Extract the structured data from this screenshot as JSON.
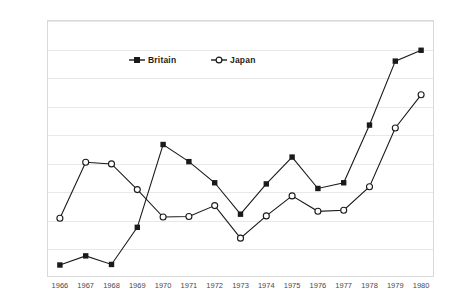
{
  "chart_data": {
    "type": "line",
    "title": "",
    "xlabel": "",
    "ylabel": "",
    "categories": [
      1966,
      1967,
      1968,
      1969,
      1970,
      1971,
      1972,
      1973,
      1974,
      1975,
      1976,
      1977,
      1978,
      1979,
      1980
    ],
    "xtick_labels": [
      "1966",
      "1967",
      "1968",
      "1969",
      "1970",
      "1971",
      "1972",
      "1973",
      "1974",
      "1975",
      "1976",
      "1977",
      "1978",
      "1979",
      "1980"
    ],
    "ytick_labels": [
      "0",
      "0.05",
      "0.1",
      "0.15",
      "0.2",
      "0.25",
      "0.3",
      "0.35",
      "0.4",
      "0.45"
    ],
    "ytick_values": [
      0,
      0.05,
      0.1,
      0.15,
      0.2,
      0.25,
      0.3,
      0.35,
      0.4,
      0.45
    ],
    "ylim": [
      0,
      0.45
    ],
    "grid": true,
    "grid_axis": "y",
    "legend_position": "top-center-inside",
    "series": [
      {
        "name": "Britain",
        "marker": "filled-square",
        "color": "#1a1a1a",
        "values": [
          0.021,
          0.037,
          0.022,
          0.087,
          0.232,
          0.202,
          0.165,
          0.11,
          0.163,
          0.21,
          0.155,
          0.165,
          0.266,
          0.378,
          0.397
        ]
      },
      {
        "name": "Japan",
        "marker": "open-circle",
        "color": "#1a1a1a",
        "values": [
          0.103,
          0.201,
          0.198,
          0.153,
          0.105,
          0.106,
          0.125,
          0.068,
          0.107,
          0.142,
          0.115,
          0.117,
          0.158,
          0.261,
          0.319
        ]
      }
    ]
  },
  "legend": {
    "britain": "Britain",
    "japan": "Japan"
  }
}
